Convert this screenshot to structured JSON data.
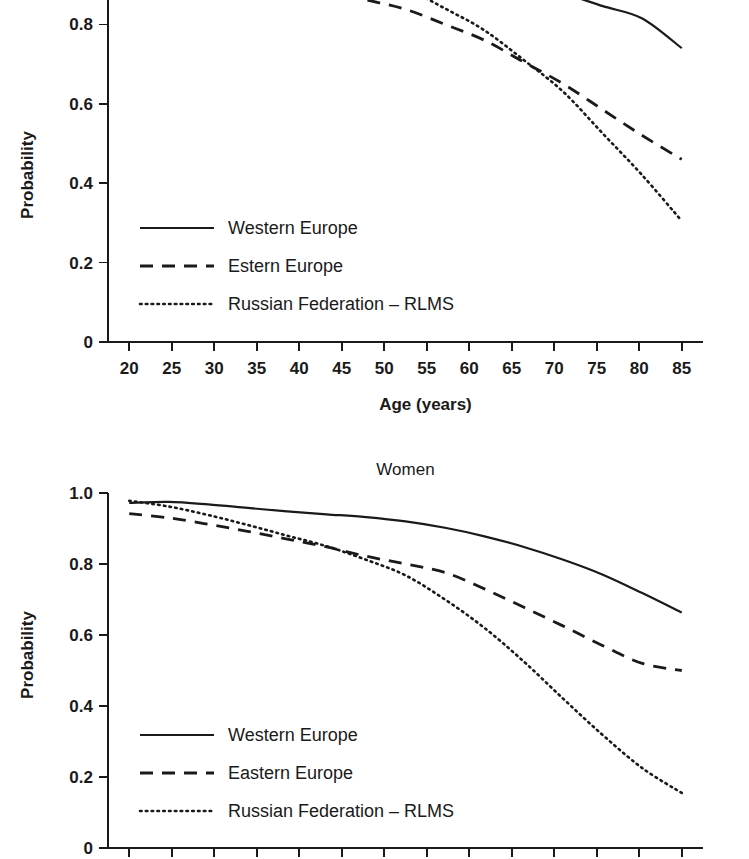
{
  "figure": {
    "background": "#ffffff",
    "ink_color": "#1a1a1a"
  },
  "chart_data": [
    {
      "id": "men",
      "type": "line",
      "title": "",
      "xlabel": "Age (years)",
      "ylabel": "Probability",
      "xlim": [
        17.5,
        87.5
      ],
      "ylim": [
        0,
        1.0
      ],
      "xticks": [
        20,
        25,
        30,
        35,
        40,
        45,
        50,
        55,
        60,
        65,
        70,
        75,
        80,
        85
      ],
      "xtick_labels": [
        "20",
        "25",
        "30",
        "35",
        "40",
        "45",
        "50",
        "55",
        "60",
        "65",
        "70",
        "75",
        "80",
        "85"
      ],
      "yticks": [
        0,
        0.2,
        0.4,
        0.6,
        0.8
      ],
      "ytick_labels": [
        "0",
        "0.2",
        "0.4",
        "0.6",
        "0.8"
      ],
      "grid": false,
      "legend_position": "lower-left",
      "clipped_top": true,
      "x": [
        20,
        25,
        30,
        35,
        40,
        45,
        50,
        55,
        60,
        65,
        70,
        75,
        80,
        85
      ],
      "series": [
        {
          "name": "Western Europe",
          "style": "solid",
          "values": [
            0.99,
            0.988,
            0.985,
            0.982,
            0.975,
            0.978,
            0.966,
            0.95,
            0.93,
            0.913,
            0.9,
            0.878,
            0.846,
            0.815,
            0.74
          ]
        },
        {
          "name": "Estern Europe",
          "style": "dashed",
          "values": [
            0.962,
            0.958,
            0.938,
            0.92,
            0.9,
            0.885,
            0.862,
            0.838,
            0.8,
            0.76,
            0.705,
            0.65,
            0.585,
            0.52,
            0.46
          ]
        },
        {
          "name": "Russian Federation – RLMS",
          "style": "dotted",
          "values": [
            0.983,
            0.977,
            0.968,
            0.958,
            0.944,
            0.93,
            0.912,
            0.89,
            0.84,
            0.785,
            0.71,
            0.63,
            0.525,
            0.42,
            0.305
          ]
        }
      ]
    },
    {
      "id": "women",
      "type": "line",
      "title": "Women",
      "xlabel": "",
      "ylabel": "Probability",
      "xlim": [
        17.5,
        87.5
      ],
      "ylim": [
        0,
        1.0
      ],
      "xticks": [
        20,
        25,
        30,
        35,
        40,
        45,
        50,
        55,
        60,
        65,
        70,
        75,
        80,
        85
      ],
      "xtick_labels": [],
      "yticks": [
        0,
        0.2,
        0.4,
        0.6,
        0.8,
        1.0
      ],
      "ytick_labels": [
        "0",
        "0.2",
        "0.4",
        "0.6",
        "0.8",
        "1.0"
      ],
      "grid": false,
      "legend_position": "lower-left",
      "clipped_bottom": true,
      "x": [
        20,
        25,
        30,
        35,
        40,
        45,
        50,
        55,
        60,
        65,
        70,
        75,
        80,
        85
      ],
      "series": [
        {
          "name": "Western Europe",
          "style": "solid",
          "values": [
            0.972,
            0.975,
            0.968,
            0.958,
            0.948,
            0.94,
            0.932,
            0.92,
            0.902,
            0.878,
            0.848,
            0.812,
            0.77,
            0.718,
            0.663
          ]
        },
        {
          "name": "Eastern Europe",
          "style": "dashed",
          "values": [
            0.942,
            0.93,
            0.912,
            0.892,
            0.87,
            0.848,
            0.822,
            0.8,
            0.776,
            0.73,
            0.678,
            0.625,
            0.57,
            0.52,
            0.5
          ]
        },
        {
          "name": "Russian Federation – RLMS",
          "style": "dotted",
          "values": [
            0.978,
            0.962,
            0.938,
            0.91,
            0.88,
            0.85,
            0.812,
            0.768,
            0.7,
            0.62,
            0.525,
            0.42,
            0.318,
            0.225,
            0.155
          ]
        }
      ]
    }
  ]
}
